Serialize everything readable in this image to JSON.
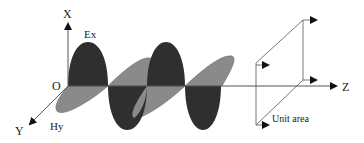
{
  "diagram": {
    "type": "electromagnetic-plane-wave",
    "axes": {
      "x_label": "X",
      "y_label": "Y",
      "z_label": "Z",
      "origin_label": "O"
    },
    "fields": {
      "electric_label": "Ex",
      "magnetic_label": "Hy"
    },
    "unit_area_label": "Unit area",
    "colors": {
      "electric_field_fill": "#2f2f2f",
      "magnetic_field_fill": "#8a8a8a",
      "line": "#555555",
      "background": "#ffffff"
    }
  }
}
